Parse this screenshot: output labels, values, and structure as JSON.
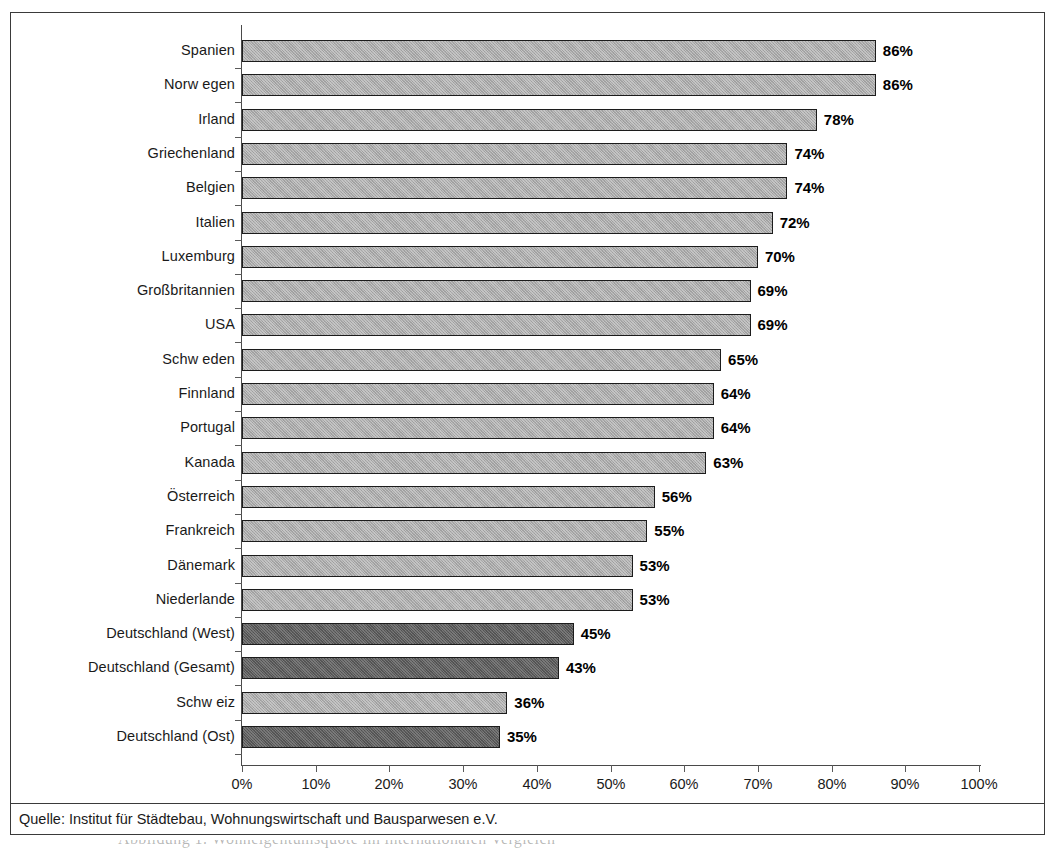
{
  "figure": {
    "source_note": "Quelle: Institut für Städtebau, Wohnungswirtschaft und Bausparwesen e.V.",
    "caption_partial": "Abbildung 1: Wohneigentumsquote im internationalen Vergleich"
  },
  "colors": {
    "bar_light": "#a9a9a9",
    "bar_dark": "#5b5b5b",
    "bar_border": "#1c1c1c",
    "frame": "#3a3a3a",
    "axis": "#4a4a4a",
    "text": "#1a1a1a"
  },
  "chart_data": {
    "type": "bar",
    "orientation": "horizontal",
    "title": "",
    "subtitle": "",
    "xlabel": "",
    "ylabel": "",
    "xlim": [
      0,
      100
    ],
    "grid": false,
    "legend": false,
    "value_suffix": "%",
    "xticks": [
      "0%",
      "10%",
      "20%",
      "30%",
      "40%",
      "50%",
      "60%",
      "70%",
      "80%",
      "90%",
      "100%"
    ],
    "xtick_values": [
      0,
      10,
      20,
      30,
      40,
      50,
      60,
      70,
      80,
      90,
      100
    ],
    "categories": [
      "Spanien",
      "Norw egen",
      "Irland",
      "Griechenland",
      "Belgien",
      "Italien",
      "Luxemburg",
      "Großbritannien",
      "USA",
      "Schw eden",
      "Finnland",
      "Portugal",
      "Kanada",
      "Österreich",
      "Frankreich",
      "Dänemark",
      "Niederlande",
      "Deutschland (West)",
      "Deutschland (Gesamt)",
      "Schw eiz",
      "Deutschland (Ost)"
    ],
    "values": [
      86,
      86,
      78,
      74,
      74,
      72,
      70,
      69,
      69,
      65,
      64,
      64,
      63,
      56,
      55,
      53,
      53,
      45,
      43,
      36,
      35
    ],
    "value_labels": [
      "86%",
      "86%",
      "78%",
      "74%",
      "74%",
      "72%",
      "70%",
      "69%",
      "69%",
      "65%",
      "64%",
      "64%",
      "63%",
      "56%",
      "55%",
      "53%",
      "53%",
      "45%",
      "43%",
      "36%",
      "35%"
    ],
    "highlight": [
      false,
      false,
      false,
      false,
      false,
      false,
      false,
      false,
      false,
      false,
      false,
      false,
      false,
      false,
      false,
      false,
      false,
      true,
      true,
      false,
      true
    ]
  }
}
